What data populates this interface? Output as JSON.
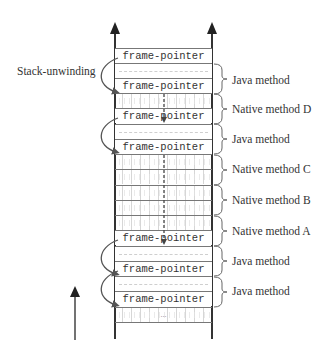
{
  "diagram": {
    "title": "",
    "side_label": "Stack-unwinding",
    "rows": [
      {
        "type": "frame-pointer",
        "text": "frame-pointer"
      },
      {
        "type": "dashed",
        "text": ""
      },
      {
        "type": "frame-pointer",
        "text": "frame-pointer"
      },
      {
        "type": "hatch",
        "text": ""
      },
      {
        "type": "frame-pointer",
        "text": "frame-pointer"
      },
      {
        "type": "dashed",
        "text": ""
      },
      {
        "type": "frame-pointer",
        "text": "frame-pointer"
      },
      {
        "type": "hatch",
        "text": ""
      },
      {
        "type": "hatch",
        "text": ""
      },
      {
        "type": "hatch",
        "text": ""
      },
      {
        "type": "hatch",
        "text": ""
      },
      {
        "type": "hatch",
        "text": ""
      },
      {
        "type": "frame-pointer",
        "text": "frame-pointer"
      },
      {
        "type": "dashed",
        "text": ""
      },
      {
        "type": "frame-pointer",
        "text": "frame-pointer"
      },
      {
        "type": "dashed",
        "text": ""
      },
      {
        "type": "frame-pointer",
        "text": "frame-pointer"
      },
      {
        "type": "hatch",
        "text": "..."
      }
    ],
    "brackets": [
      {
        "label": "Java method"
      },
      {
        "label": "Native method D"
      },
      {
        "label": "Java method"
      },
      {
        "label": "Native method C"
      },
      {
        "label": "Native method B"
      },
      {
        "label": "Native method A"
      },
      {
        "label": "Java method"
      },
      {
        "label": "Java method"
      }
    ],
    "colors": {
      "line": "#333333",
      "arrow": "#555555",
      "hatch": "#d6d6d6"
    }
  }
}
